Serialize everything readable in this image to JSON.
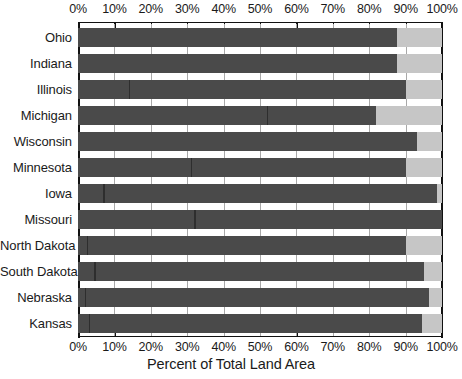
{
  "chart_data": {
    "type": "bar",
    "orientation": "horizontal",
    "stacked": true,
    "title": "",
    "xlabel": "Percent of Total Land Area",
    "ylabel": "",
    "xlim": [
      0,
      100
    ],
    "xtick_labels": [
      "0%",
      "10%",
      "20%",
      "30%",
      "40%",
      "50%",
      "60%",
      "70%",
      "80%",
      "90%",
      "100%"
    ],
    "xtick_values": [
      0,
      10,
      20,
      30,
      40,
      50,
      60,
      70,
      80,
      90,
      100
    ],
    "xtick_axes": [
      "top",
      "bottom"
    ],
    "grid": true,
    "legend": "none",
    "categories": [
      "Ohio",
      "Indiana",
      "Illinois",
      "Michigan",
      "Wisconsin",
      "Minnesota",
      "Iowa",
      "Missouri",
      "North Dakota",
      "South Dakota",
      "Nebraska",
      "Kansas"
    ],
    "series": [
      {
        "name": "Dark segment (private / covered land)",
        "color": "#4a4a4a",
        "values": [
          87.5,
          87.5,
          90.0,
          82.0,
          93.0,
          90.0,
          98.5,
          100.0,
          90.0,
          95.0,
          96.5,
          94.5
        ]
      },
      {
        "name": "Light segment (remainder to 100%)",
        "color": "#c6c6c6",
        "values": [
          12.5,
          12.5,
          10.0,
          18.0,
          7.0,
          10.0,
          1.5,
          0.0,
          10.0,
          5.0,
          3.5,
          5.5
        ]
      }
    ],
    "internal_dividers": [
      {
        "category": "Ohio",
        "at": []
      },
      {
        "category": "Indiana",
        "at": []
      },
      {
        "category": "Illinois",
        "at": [
          14.0
        ]
      },
      {
        "category": "Michigan",
        "at": [
          52.0
        ]
      },
      {
        "category": "Wisconsin",
        "at": []
      },
      {
        "category": "Minnesota",
        "at": [
          31.0
        ]
      },
      {
        "category": "Iowa",
        "at": [
          7.0
        ]
      },
      {
        "category": "Missouri",
        "at": [
          32.0
        ]
      },
      {
        "category": "North Dakota",
        "at": [
          2.5
        ]
      },
      {
        "category": "South Dakota",
        "at": [
          4.5
        ]
      },
      {
        "category": "Nebraska",
        "at": [
          2.0
        ]
      },
      {
        "category": "Kansas",
        "at": [
          3.0
        ]
      }
    ]
  },
  "colors": {
    "dark": "#4a4a4a",
    "light": "#c6c6c6",
    "axis": "#111111",
    "grid": "#a8a8a8",
    "background": "#ffffff",
    "text": "#1a1a1a"
  }
}
